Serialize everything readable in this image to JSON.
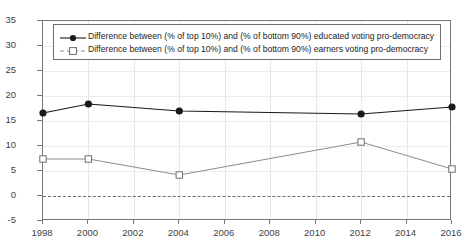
{
  "chart_data": {
    "type": "line",
    "title": "",
    "xlabel": "",
    "ylabel": "",
    "x": [
      1998,
      2000,
      2004,
      2012,
      2016
    ],
    "xlim": [
      1998,
      2016
    ],
    "ylim": [
      -5,
      35
    ],
    "grid": true,
    "legend_position": "top-left inside",
    "xticks": [
      "1998",
      "2000",
      "2002",
      "2004",
      "2006",
      "2008",
      "2010",
      "2012",
      "2014",
      "2016"
    ],
    "xtick_values": [
      1998,
      2000,
      2002,
      2004,
      2006,
      2008,
      2010,
      2012,
      2014,
      2016
    ],
    "yticks": [
      "35",
      "30",
      "25",
      "20",
      "15",
      "10",
      "5",
      "0",
      "-5"
    ],
    "ytick_values": [
      35,
      30,
      25,
      20,
      15,
      10,
      5,
      0,
      -5
    ],
    "annotations": [
      {
        "name": "zero-reference-line",
        "y": 0,
        "style": "dashed"
      }
    ],
    "series": [
      {
        "name": "Difference between (% of top 10%) and (% of bottom 90%) educated voting pro-democracy",
        "marker": "filled-circle",
        "color": "#1a1a1a",
        "values": [
          16.6,
          18.4,
          17.0,
          16.4,
          17.8
        ]
      },
      {
        "name": "Difference between (% of top 10%) and (% of bottom 90%) earners voting pro-democracy",
        "marker": "open-square",
        "color": "#8c8c8c",
        "values": [
          7.4,
          7.4,
          4.2,
          10.8,
          5.4
        ]
      }
    ]
  },
  "legend": {
    "entries": [
      {
        "label": "Difference between (% of top 10%) and (% of bottom 90%) educated voting pro-democracy"
      },
      {
        "label": "Difference between (% of top 10%) and (% of bottom 90%) earners voting pro-democracy"
      }
    ]
  },
  "colors": {
    "series_educated": "#1a1a1a",
    "series_earners": "#8c8c8c",
    "axis": "#777777",
    "grid": "#e6e6e6",
    "zero_line": "#6b6b6b",
    "background": "#ffffff"
  }
}
